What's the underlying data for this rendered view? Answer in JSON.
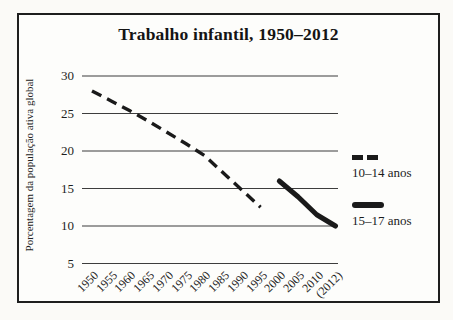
{
  "title_block": {
    "title": "Trabalho infantil, 1950–2012"
  },
  "chart_data": {
    "type": "line",
    "title": "Trabalho infantil, 1950–2012",
    "xlabel": "",
    "ylabel": "Porcentagem da população ativa global",
    "x_ticks": [
      "1950",
      "1955",
      "1960",
      "1965",
      "1970",
      "1975",
      "1980",
      "1985",
      "1990",
      "1995",
      "2000",
      "2005",
      "2010",
      "(2012)"
    ],
    "y_ticks_top_to_bottom": [
      30,
      25,
      20,
      15,
      10,
      5
    ],
    "ylim": [
      2.5,
      32.5
    ],
    "grid": "horizontal-only",
    "legend_position": "right-outside",
    "line_color": "#1a1a1a",
    "gridline_color": "#3d3d3d",
    "series": [
      {
        "name": "10–14 anos",
        "style": "dashed",
        "x": [
          "1950",
          "1955",
          "1960",
          "1965",
          "1970",
          "1975",
          "1980",
          "1985",
          "1990",
          "1995"
        ],
        "values": [
          28,
          26.7,
          25.4,
          24,
          22.5,
          21,
          19.4,
          17.1,
          14.8,
          12.5
        ]
      },
      {
        "name": "15–17 anos",
        "style": "solid-thick",
        "x": [
          "2000",
          "2005",
          "2010",
          "(2012)"
        ],
        "values": [
          16,
          13.9,
          11.5,
          10
        ]
      }
    ]
  }
}
